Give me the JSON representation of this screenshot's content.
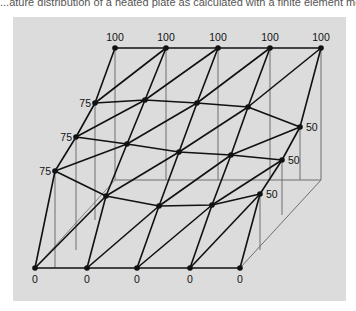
{
  "caption": "...ature distribution of a heated plate as calculated with a finite element me...",
  "diagram": {
    "type": "finite-element-mesh-3d-surface",
    "colors": {
      "background": "#dcdcdc",
      "mesh": "#111111",
      "guide": "#6e6e6e",
      "page": "#ffffff"
    },
    "top_labels": [
      "100",
      "100",
      "100",
      "100",
      "100"
    ],
    "left_labels": [
      "75",
      "75",
      "75"
    ],
    "right_labels": [
      "50",
      "50",
      "50"
    ],
    "bottom_labels": [
      "0",
      "0",
      "0",
      "0",
      "0"
    ]
  }
}
